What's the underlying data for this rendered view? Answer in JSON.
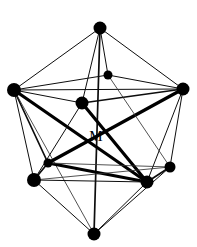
{
  "figure": {
    "name": "icosahedron-coordination-polyhedron",
    "background_color": "#ffffff",
    "line_color": "#000000",
    "vertex_color": "#000000",
    "width": 197,
    "height": 247,
    "center_label": "M",
    "center_label_x": 96,
    "center_label_y": 136
  },
  "vertices": [
    {
      "id": "v-top-apex",
      "label": "",
      "x": 100,
      "y": 28,
      "r": 6.5
    },
    {
      "id": "v-upper-inner",
      "label": "",
      "x": 108,
      "y": 75,
      "r": 4.5
    },
    {
      "id": "v-left",
      "label": "",
      "x": 14,
      "y": 90,
      "r": 7.0
    },
    {
      "id": "v-right",
      "label": "",
      "x": 183,
      "y": 89,
      "r": 6.5
    },
    {
      "id": "v-upper-mid-left",
      "label": "",
      "x": 82,
      "y": 103,
      "r": 6.5
    },
    {
      "id": "v-lower-inner-left",
      "label": "",
      "x": 48,
      "y": 163,
      "r": 4.5
    },
    {
      "id": "v-lower-right-up",
      "label": "",
      "x": 170,
      "y": 167,
      "r": 5.5
    },
    {
      "id": "v-lower-left",
      "label": "",
      "x": 34,
      "y": 180,
      "r": 7.0
    },
    {
      "id": "v-lower-mid-right",
      "label": "",
      "x": 147,
      "y": 182,
      "r": 6.5
    },
    {
      "id": "v-bottom-apex",
      "label": "",
      "x": 94,
      "y": 234,
      "r": 6.5
    }
  ],
  "edges": [
    {
      "from": "v-top-apex",
      "to": "v-left",
      "weight": "thin"
    },
    {
      "from": "v-top-apex",
      "to": "v-right",
      "weight": "thin"
    },
    {
      "from": "v-top-apex",
      "to": "v-upper-mid-left",
      "weight": "thin"
    },
    {
      "from": "v-top-apex",
      "to": "v-upper-inner",
      "weight": "thin"
    },
    {
      "from": "v-top-apex",
      "to": "v-bottom-apex",
      "weight": "medium"
    },
    {
      "from": "v-left",
      "to": "v-right",
      "weight": "thin"
    },
    {
      "from": "v-left",
      "to": "v-upper-inner",
      "weight": "thin"
    },
    {
      "from": "v-left",
      "to": "v-upper-mid-left",
      "weight": "thin"
    },
    {
      "from": "v-left",
      "to": "v-lower-inner-left",
      "weight": "medium"
    },
    {
      "from": "v-left",
      "to": "v-lower-left",
      "weight": "thin"
    },
    {
      "from": "v-left",
      "to": "v-lower-mid-right",
      "weight": "bold"
    },
    {
      "from": "v-left",
      "to": "v-bottom-apex",
      "weight": "hair"
    },
    {
      "from": "v-right",
      "to": "v-upper-inner",
      "weight": "thin"
    },
    {
      "from": "v-right",
      "to": "v-upper-mid-left",
      "weight": "medium"
    },
    {
      "from": "v-right",
      "to": "v-lower-inner-left",
      "weight": "bold"
    },
    {
      "from": "v-right",
      "to": "v-lower-right-up",
      "weight": "thin"
    },
    {
      "from": "v-right",
      "to": "v-lower-mid-right",
      "weight": "thin"
    },
    {
      "from": "v-upper-mid-left",
      "to": "v-lower-mid-right",
      "weight": "bold"
    },
    {
      "from": "v-upper-mid-left",
      "to": "v-lower-left",
      "weight": "thin"
    },
    {
      "from": "v-upper-inner",
      "to": "v-lower-right-up",
      "weight": "hair"
    },
    {
      "from": "v-lower-inner-left",
      "to": "v-lower-left",
      "weight": "medium"
    },
    {
      "from": "v-lower-inner-left",
      "to": "v-lower-mid-right",
      "weight": "bold"
    },
    {
      "from": "v-lower-inner-left",
      "to": "v-lower-right-up",
      "weight": "hair"
    },
    {
      "from": "v-lower-left",
      "to": "v-lower-mid-right",
      "weight": "thin"
    },
    {
      "from": "v-lower-left",
      "to": "v-bottom-apex",
      "weight": "thin"
    },
    {
      "from": "v-lower-left",
      "to": "v-lower-right-up",
      "weight": "hair"
    },
    {
      "from": "v-lower-mid-right",
      "to": "v-lower-right-up",
      "weight": "medium"
    },
    {
      "from": "v-lower-mid-right",
      "to": "v-bottom-apex",
      "weight": "thin"
    },
    {
      "from": "v-lower-right-up",
      "to": "v-bottom-apex",
      "weight": "thin"
    }
  ]
}
